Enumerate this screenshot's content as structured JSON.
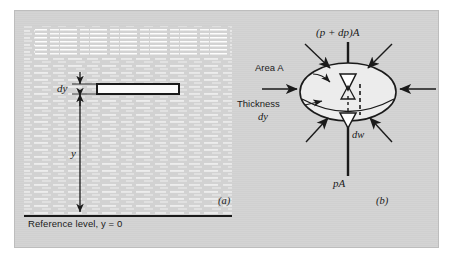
{
  "figure": {
    "kind": "physics-textbook-diagram",
    "background_color": "#d2d2d2",
    "ink_color": "#1a1a1a",
    "panels": [
      {
        "id": "a",
        "label": "(a)",
        "caption_label": "Reference level, y = 0"
      },
      {
        "id": "b",
        "label": "(b)"
      }
    ]
  },
  "panel_a": {
    "label": "(a)",
    "slab_label": "dy",
    "height_label": "y",
    "reference_line_label": "Reference level, y = 0",
    "fluid_description": "hatched liquid body with horizontal stipple lines",
    "slab_description": "thin white rectangle outlined in black representing the element of thickness dy"
  },
  "panel_b": {
    "label": "(b)",
    "top_force_label": "(p + dp)A",
    "bottom_force_label": "pA",
    "weight_label": "dw",
    "area_label": "Area A",
    "thickness_label_line1": "Thickness",
    "thickness_label_line2": "dy",
    "element_description": "elliptical disc element with pressure forces acting normal to all surfaces"
  },
  "colors": {
    "panel_background": "#d2d2d2",
    "ink": "#1a1a1a",
    "element_fill": "#e8e8e8",
    "slab_fill": "#f2f2f2"
  }
}
